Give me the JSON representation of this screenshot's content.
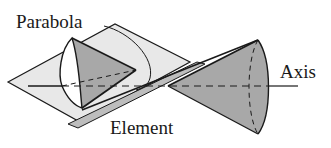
{
  "diagram": {
    "labels": {
      "parabola": "Parabola",
      "axis": "Axis",
      "element": "Element"
    },
    "colors": {
      "plane_fill": "#e6e6e6",
      "cone_fill": "#a8a8a8",
      "stroke": "#1a1a1a",
      "background": "#ffffff"
    }
  }
}
